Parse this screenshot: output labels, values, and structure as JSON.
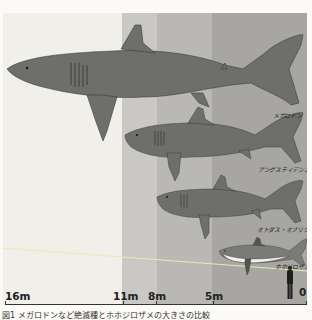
{
  "figure": {
    "bands": [
      {
        "name": "band-16-11",
        "from_px": 0,
        "to_px": 119,
        "color": "#f0efea"
      },
      {
        "name": "band-11-8",
        "from_px": 119,
        "to_px": 154,
        "color": "#c9c8c4"
      },
      {
        "name": "band-8-5",
        "from_px": 154,
        "to_px": 209,
        "color": "#b9b8b4"
      },
      {
        "name": "band-5-0",
        "from_px": 209,
        "to_px": 304,
        "color": "#a7a6a3"
      }
    ],
    "species": [
      {
        "name": "megalodon",
        "label": "メガロドン"
      },
      {
        "name": "angustidens",
        "label": "アングスティデンス"
      },
      {
        "name": "otodus-obliquus",
        "label": "オトダス・オブリクース"
      },
      {
        "name": "great-white",
        "label": "ホホジロザメ"
      }
    ],
    "colors": {
      "shark_body": "#6e6e6c",
      "shark_outline": "#3d3d3b",
      "great_white_belly": "#f2f2f0",
      "water_line": "#eceab0",
      "axis": "#333333"
    }
  },
  "axis": {
    "ticks": [
      {
        "label": "16m",
        "x": 5
      },
      {
        "label": "11m",
        "x": 114
      },
      {
        "label": "8m",
        "x": 148
      },
      {
        "label": "5m",
        "x": 205
      },
      {
        "label": "0",
        "x": 303
      }
    ]
  },
  "caption": "図1 メガロドンなど絶滅種とホホジロザメの大きさの比較"
}
